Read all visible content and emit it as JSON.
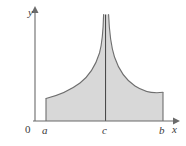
{
  "figure": {
    "kind": "improper-integral-diagram",
    "colors": {
      "fill": "#d8d8d8",
      "curve_stroke": "#6e6e6e",
      "axis_stroke": "#6b6b6b",
      "asymptote_stroke": "#4a4a4a",
      "label_color": "#3a3a3a",
      "background": "#ffffff"
    },
    "axes": {
      "x_axis": {
        "label": "x",
        "start_px": 33,
        "end_px": 178,
        "y_px": 121,
        "arrow": true
      },
      "y_axis": {
        "label": "y",
        "x_px": 35,
        "top_px": 11,
        "bottom_px": 121,
        "arrow": true
      },
      "origin_label": "0"
    },
    "tick_labels": [
      {
        "name": "a",
        "text": "a",
        "x_px": 46
      },
      {
        "name": "c",
        "text": "c",
        "x_px": 106
      },
      {
        "name": "b",
        "text": "b",
        "x_px": 163
      }
    ],
    "region": {
      "left_bound": "a",
      "right_bound": "b",
      "asymptote_at": "c",
      "left_edge_x_px": 46,
      "right_edge_x_px": 163,
      "baseline_y_px": 121,
      "left_curve_start_y_px": 98,
      "right_curve_end_y_px": 92,
      "asymptote_top_y_px": 14
    }
  }
}
